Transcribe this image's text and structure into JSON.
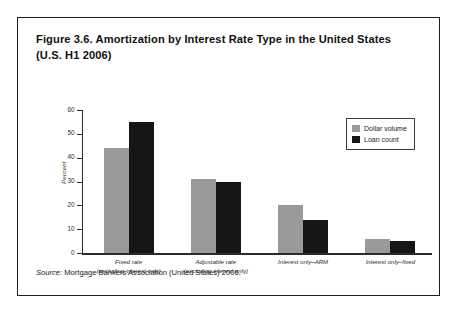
{
  "figure": {
    "title_line1": "Figure 3.6. Amortization by Interest Rate Type in the United States",
    "title_line2": "(U.S. H1 2006)",
    "source_prefix": "Source:",
    "source_text": "Mortgage Bankers Association (United States) 2006.",
    "border_color": "#1d1d1d"
  },
  "legend": {
    "items": [
      {
        "label": "Dollar volume",
        "color": "#9a9a9a"
      },
      {
        "label": "Loan count",
        "color": "#161616"
      }
    ]
  },
  "chart_data": {
    "type": "bar",
    "title": "Figure 3.6. Amortization by Interest Rate Type in the United States (U.S. H1 2006)",
    "xlabel": "",
    "ylabel": "Percent",
    "ylim": [
      0,
      60
    ],
    "yticks": [
      0,
      10,
      20,
      30,
      40,
      50,
      60
    ],
    "ytick_labels": [
      "0",
      "10",
      "20",
      "30",
      "40",
      "50",
      "60"
    ],
    "grid": false,
    "legend_position": "top-right",
    "categories": [
      "Fixed rate\n(excluding interest only)",
      "Adjustable rate\n(excluding interest only)",
      "Interest only–ARM",
      "Interest only–fixed"
    ],
    "category_lines": [
      [
        "Fixed rate",
        "(excluding interest only)"
      ],
      [
        "Adjustable rate",
        "(excluding interest only)"
      ],
      [
        "Interest only–ARM",
        ""
      ],
      [
        "Interest only–fixed",
        ""
      ]
    ],
    "series": [
      {
        "name": "Dollar volume",
        "color": "#9a9a9a",
        "values": [
          44,
          31,
          20,
          6
        ]
      },
      {
        "name": "Loan count",
        "color": "#161616",
        "values": [
          55,
          30,
          14,
          5
        ]
      }
    ]
  }
}
